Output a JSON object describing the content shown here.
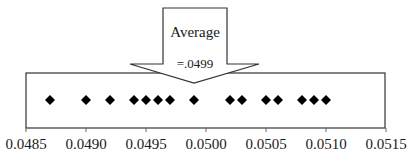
{
  "chart_data": {
    "type": "scatter",
    "subtype": "dot-plot",
    "title": "",
    "xlabel": "",
    "ylabel": "",
    "xlim": [
      0.0485,
      0.0515
    ],
    "x_ticks": [
      0.0485,
      0.049,
      0.0495,
      0.05,
      0.0505,
      0.051,
      0.0515
    ],
    "x_tick_labels": [
      "0.0485",
      "0.0490",
      "0.0495",
      "0.0500",
      "0.0505",
      "0.0510",
      "0.0515"
    ],
    "grid": false,
    "legend": null,
    "marker": "diamond",
    "marker_color": "#000000",
    "values": [
      0.0487,
      0.049,
      0.0492,
      0.0494,
      0.0495,
      0.0496,
      0.0497,
      0.0499,
      0.0502,
      0.0503,
      0.0505,
      0.0506,
      0.0508,
      0.0509,
      0.051
    ],
    "annotations": [
      {
        "type": "down-arrow-callout",
        "line1": "Average",
        "line2": "=.0499",
        "points_to": 0.0499
      }
    ]
  },
  "labels": {
    "arrow_line1": "Average",
    "arrow_line2": "=.0499"
  }
}
